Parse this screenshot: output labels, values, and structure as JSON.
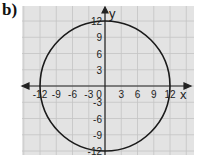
{
  "part_label": "b)",
  "chart_data": {
    "type": "line",
    "title": "",
    "shape": {
      "kind": "circle",
      "center": [
        0,
        0
      ],
      "radius": 12
    },
    "xlabel": "x",
    "ylabel": "y",
    "xlim": [
      -15,
      15
    ],
    "ylim": [
      -12,
      12
    ],
    "grid": true,
    "x_ticks": [
      "-12",
      "-9",
      "-6",
      "-3",
      "0",
      "3",
      "6",
      "9",
      "12"
    ],
    "y_ticks": [
      "12",
      "9",
      "6",
      "3",
      "-3",
      "-6",
      "-9",
      "-12"
    ],
    "colors": {
      "grid_bg": "#e3e3e3",
      "grid_line": "#c4c4c4",
      "curve": "#1a1a1a",
      "axis": "#222222"
    }
  }
}
